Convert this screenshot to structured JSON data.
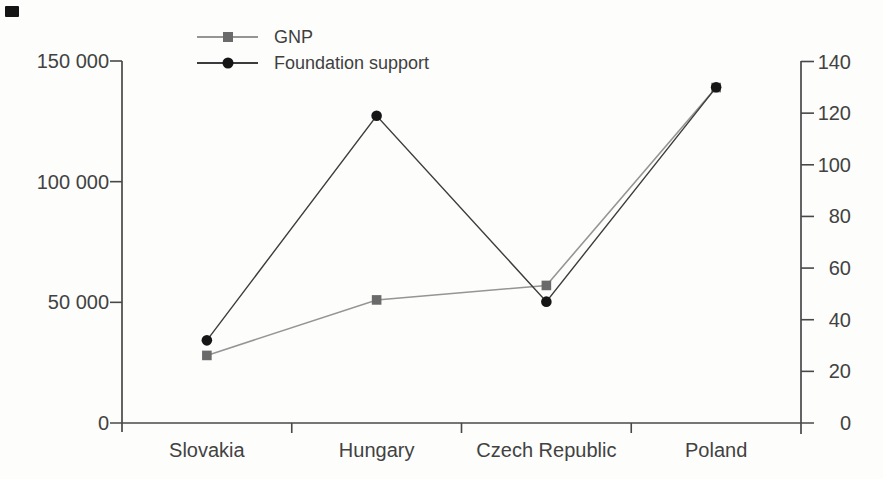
{
  "figure": {
    "background": "#fdfdfc",
    "text_color": "#424242",
    "axis_color": "#484848"
  },
  "chart_data": {
    "type": "line",
    "categories": [
      "Slovakia",
      "Hungary",
      "Czech Republic",
      "Poland"
    ],
    "series": [
      {
        "name": "GNP",
        "axis": "left",
        "marker": "square",
        "marker_color": "#6a6a6a",
        "line_color": "#959595",
        "values": [
          28000,
          51000,
          57000,
          139000
        ]
      },
      {
        "name": "Foundation support",
        "axis": "right",
        "marker": "circle",
        "marker_color": "#161616",
        "line_color": "#3c3c3c",
        "values": [
          32,
          119,
          47,
          130
        ]
      }
    ],
    "left_axis": {
      "range": [
        0,
        150000
      ],
      "tick_values": [
        0,
        50000,
        100000,
        150000
      ],
      "tick_labels": [
        "0",
        "50 000",
        "100 000",
        "150 000"
      ]
    },
    "right_axis": {
      "range": [
        0,
        140
      ],
      "tick_values": [
        0,
        20,
        40,
        60,
        80,
        100,
        120,
        140
      ],
      "tick_labels": [
        "0",
        "20",
        "40",
        "60",
        "80",
        "100",
        "120",
        "140"
      ]
    },
    "grid": false,
    "legend_position": "top-center"
  }
}
